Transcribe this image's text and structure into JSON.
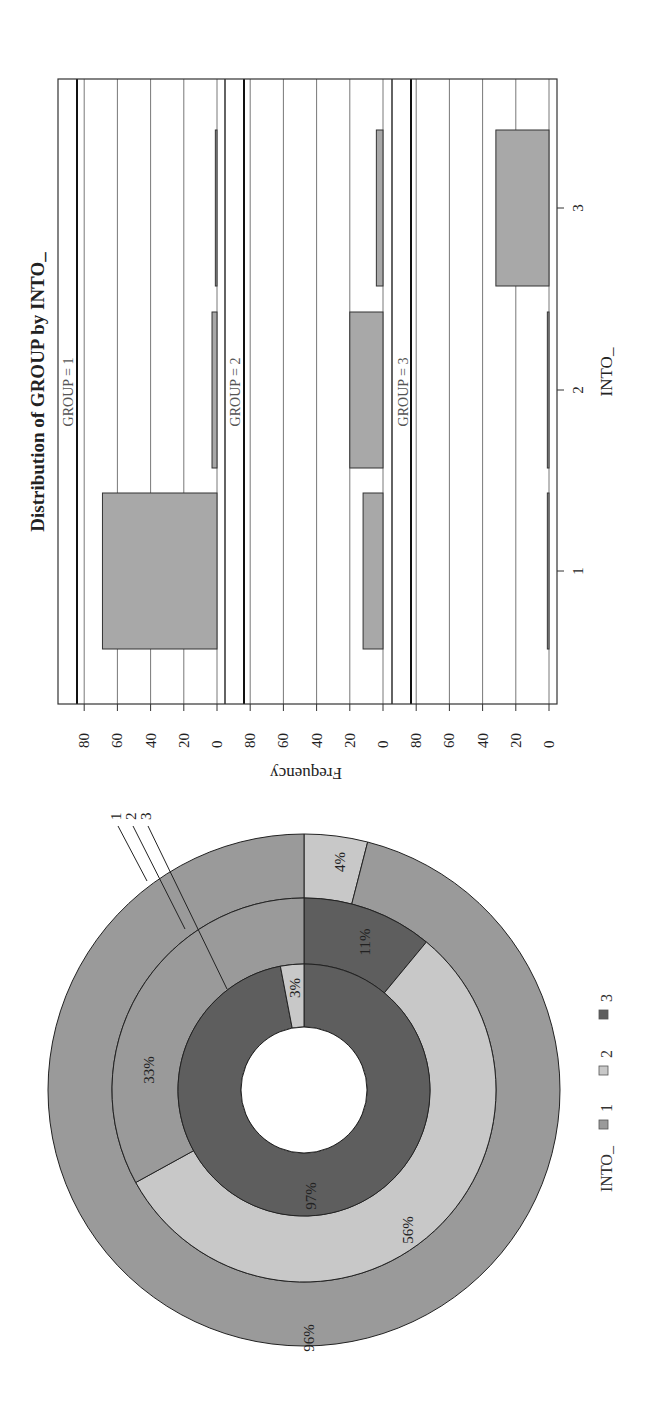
{
  "colors": {
    "into_1": "#9a9a9a",
    "into_2": "#c8c8c8",
    "into_3": "#5e5e5e",
    "bar_fill": "#a8a8a8",
    "frame": "#333333",
    "grid": "#555555"
  },
  "bar_panel": {
    "title": "Distribution of GROUP by INTO_",
    "ylabel": "Frequency",
    "xlabel": "INTO_",
    "y_ticks": [
      "0",
      "20",
      "40",
      "60",
      "80"
    ],
    "x_ticks": [
      "1",
      "2",
      "3"
    ],
    "strips": [
      "GROUP = 1",
      "GROUP = 2",
      "GROUP = 3"
    ]
  },
  "donut": {
    "ring_labels": [
      "1",
      "2",
      "3"
    ],
    "legend_title": "INTO_",
    "legend_items": [
      "1",
      "2",
      "3"
    ],
    "labels": {
      "outer_into1": "96%",
      "outer_into2": "4%",
      "middle_into1": "33%",
      "middle_into2": "56%",
      "middle_into3": "11%",
      "inner_into2": "3%",
      "inner_into3": "97%"
    }
  },
  "chart_data": [
    {
      "type": "bar",
      "title": "Distribution of GROUP by INTO_",
      "xlabel": "INTO_",
      "ylabel": "Frequency",
      "categories": [
        "1",
        "2",
        "3"
      ],
      "panels": [
        "GROUP = 1",
        "GROUP = 2",
        "GROUP = 3"
      ],
      "series": [
        {
          "name": "GROUP = 1",
          "values": [
            69,
            3,
            1
          ]
        },
        {
          "name": "GROUP = 2",
          "values": [
            12,
            20,
            4
          ]
        },
        {
          "name": "GROUP = 3",
          "values": [
            1,
            1,
            32
          ]
        }
      ],
      "ylim": [
        0,
        90
      ],
      "yticks": [
        0,
        20,
        40,
        60,
        80
      ],
      "grid": true,
      "orientation": "rotated 90 degrees (figure printed sideways)"
    },
    {
      "type": "pie",
      "subtype": "nested donut",
      "legend_title": "INTO_",
      "legend": [
        "1",
        "2",
        "3"
      ],
      "rings": [
        {
          "name": "1",
          "position": "outer",
          "categories": [
            "1",
            "2"
          ],
          "values": [
            96,
            4
          ]
        },
        {
          "name": "2",
          "position": "middle",
          "categories": [
            "1",
            "2",
            "3"
          ],
          "values": [
            33,
            56,
            11
          ]
        },
        {
          "name": "3",
          "position": "inner",
          "categories": [
            "2",
            "3"
          ],
          "values": [
            3,
            97
          ]
        }
      ],
      "legend_position": "bottom"
    }
  ]
}
